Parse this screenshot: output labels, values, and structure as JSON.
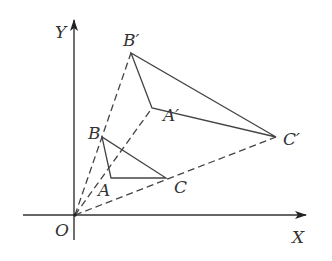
{
  "diagram": {
    "axes": {
      "x_label": "X",
      "y_label": "Y",
      "origin_label": "O"
    },
    "points": {
      "O": {
        "label": "O",
        "x": 75,
        "y": 215
      },
      "A": {
        "label": "A",
        "x": 111,
        "y": 178
      },
      "B": {
        "label": "B",
        "x": 102,
        "y": 137
      },
      "C": {
        "label": "C",
        "x": 166,
        "y": 178
      },
      "A_prime": {
        "label": "A′",
        "x": 152,
        "y": 108
      },
      "B_prime": {
        "label": "B′",
        "x": 131,
        "y": 53
      },
      "C_prime": {
        "label": "C′",
        "x": 276,
        "y": 137
      }
    },
    "segments": {
      "solid": [
        "AB",
        "BC",
        "CA",
        "A'B'",
        "B'C'",
        "C'A'"
      ],
      "dashed": [
        "OB'",
        "OA'",
        "OC'"
      ]
    },
    "colors": {
      "line": "#444444",
      "text": "#333333",
      "background": "#ffffff"
    }
  }
}
